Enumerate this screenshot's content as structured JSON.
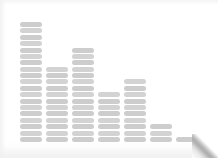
{
  "card": {
    "background_color": "#ffffff",
    "corner_fold": "page-curl-bottom-right"
  },
  "chart_data": {
    "type": "bar",
    "title": "",
    "subtitle": "",
    "xlabel": "",
    "ylabel": "",
    "categories": [
      "1",
      "2",
      "3",
      "4",
      "5",
      "6",
      "7"
    ],
    "values": [
      19,
      12,
      15,
      8,
      10,
      3,
      1
    ],
    "ylim": [
      0,
      20
    ],
    "grid": false,
    "legend": null,
    "style": "segmented-stacked-blocks",
    "bar_color": "#cfcfcf",
    "segment_height_px": 5,
    "segment_gap_px": 1.4,
    "bar_width_px": 22,
    "bar_gap_px": 4,
    "baseline_y_px": 142,
    "bars": [
      {
        "index": 1,
        "segments": 19,
        "left_px": 20,
        "top_px": 18
      },
      {
        "index": 2,
        "segments": 12,
        "left_px": 46,
        "top_px": 65
      },
      {
        "index": 3,
        "segments": 15,
        "left_px": 72,
        "top_px": 47
      },
      {
        "index": 4,
        "segments": 8,
        "left_px": 98,
        "top_px": 90
      },
      {
        "index": 5,
        "segments": 10,
        "left_px": 124,
        "top_px": 80
      },
      {
        "index": 6,
        "segments": 3,
        "left_px": 150,
        "top_px": 122
      },
      {
        "index": 7,
        "segments": 1,
        "left_px": 176,
        "top_px": 134
      }
    ]
  }
}
